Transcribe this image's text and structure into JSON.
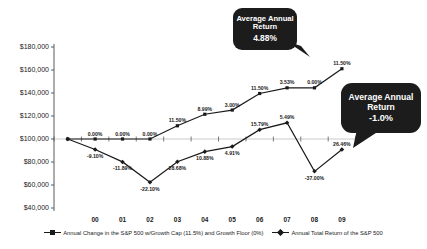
{
  "chart_data": {
    "type": "line",
    "title": "",
    "categories": [
      "00",
      "01",
      "02",
      "03",
      "04",
      "05",
      "06",
      "07",
      "08",
      "09"
    ],
    "start_value": 100000,
    "y_axis": {
      "min": 40000,
      "max": 180000,
      "step": 20000,
      "tick_labels": [
        "$180,000",
        "$160,000",
        "$140,000",
        "$120,000",
        "$100,000",
        "$80,000",
        "$60,000",
        "$40,000"
      ],
      "x_axis_crosses_at": 100000
    },
    "grid": "horizontal line at $100,000 only",
    "legend_position": "bottom",
    "series": [
      {
        "name": "Annual Change in the S&P 500 w/Growth Cap (11.5%) and Growth Floor (0%)",
        "marker": "square",
        "pct_changes": [
          0.0,
          0.0,
          0.0,
          11.5,
          8.99,
          3.0,
          11.5,
          3.53,
          0.0,
          11.5
        ],
        "labels": [
          "0.00%",
          "0.00%",
          "0.00%",
          "11.50%",
          "8.99%",
          "3.00%",
          "11.50%",
          "3.53%",
          "0.00%",
          "11.50%"
        ],
        "label_side": [
          "above",
          "above",
          "above",
          "above",
          "above",
          "above",
          "above",
          "above",
          "above",
          "above"
        ]
      },
      {
        "name": "Annual Total Return of the S&P 500",
        "marker": "diamond",
        "pct_changes": [
          -9.1,
          -11.89,
          -22.1,
          28.68,
          10.88,
          4.91,
          15.79,
          5.49,
          -37.0,
          26.46
        ],
        "labels": [
          "-9.10%",
          "-11.89%",
          "-22.10%",
          "28.68%",
          "10.88%",
          "4.91%",
          "15.79%",
          "5.49%",
          "-37.00%",
          "26.46%"
        ],
        "label_side": [
          "below",
          "below",
          "below",
          "below",
          "below",
          "below",
          "above",
          "above",
          "below",
          "above"
        ]
      }
    ]
  },
  "callouts": [
    {
      "title": "Average Annual Return",
      "value": "4.88%"
    },
    {
      "title": "Average Annual Return",
      "value": "-1.0%"
    }
  ],
  "colors": {
    "line": "#1a1a1a",
    "marker": "#1a1a1a",
    "gridline": "#bdbdbd",
    "axis": "#5a5a5a",
    "text": "#1a1a1a",
    "callout_bg": "#1c1c1c",
    "callout_text": "#ffffff"
  }
}
